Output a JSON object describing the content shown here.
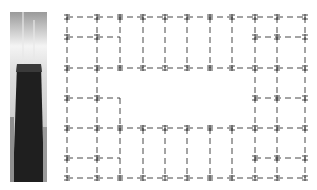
{
  "figure": {
    "photo": {
      "subject": "skyscraper-tower-photo"
    },
    "plan": {
      "type": "structural-framing-plan",
      "columns_x": [
        67,
        97,
        120,
        143,
        165,
        187,
        210,
        232,
        255,
        277,
        305
      ],
      "rows_y": [
        17,
        37,
        68,
        98,
        128,
        158,
        178
      ],
      "line_color": "#333333"
    }
  }
}
